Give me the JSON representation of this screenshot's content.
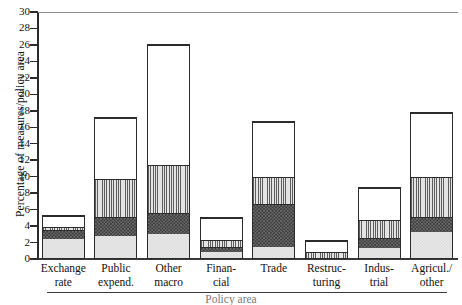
{
  "chart_data": {
    "type": "bar",
    "stacked": true,
    "title": "",
    "xlabel": "Policy area",
    "ylabel": "Percentage of measures/policy area",
    "ylim": [
      0,
      30
    ],
    "ytick_step": 2,
    "yticks": [
      30,
      28,
      26,
      24,
      22,
      20,
      18,
      16,
      14,
      12,
      10,
      8,
      6,
      4,
      2,
      0
    ],
    "grid": false,
    "legend": "none",
    "categories": [
      "Exchange rate",
      "Public expend.",
      "Other macro",
      "Financial",
      "Trade",
      "Restructuring",
      "Industrial",
      "Agricul./other"
    ],
    "category_lines": [
      [
        "Exchange",
        "rate"
      ],
      [
        "Public",
        "expend."
      ],
      [
        "Other",
        "macro"
      ],
      [
        "Finan-",
        "cial"
      ],
      [
        "Trade",
        ""
      ],
      [
        "Restruc-",
        "turing"
      ],
      [
        "Indus-",
        "trial"
      ],
      [
        "Agricul./",
        "other"
      ]
    ],
    "series": [
      {
        "name": "segment-1",
        "fill": "light-gray-check",
        "values": [
          2.4,
          2.7,
          3.0,
          0.8,
          1.4,
          0.0,
          1.2,
          3.2
        ]
      },
      {
        "name": "segment-2",
        "fill": "dark-check",
        "values": [
          1.2,
          2.4,
          2.5,
          0.6,
          5.3,
          0.0,
          1.3,
          1.9
        ]
      },
      {
        "name": "segment-3",
        "fill": "vertical-stripe",
        "values": [
          0.3,
          4.6,
          5.9,
          0.9,
          3.3,
          0.8,
          2.2,
          4.9
        ]
      },
      {
        "name": "segment-4",
        "fill": "white",
        "values": [
          1.4,
          7.5,
          14.7,
          2.8,
          6.8,
          1.5,
          4.0,
          7.8
        ]
      }
    ],
    "totals": [
      5.3,
      17.2,
      26.1,
      5.1,
      16.8,
      2.3,
      8.7,
      17.8
    ]
  },
  "colors": {
    "axis": "#2b2b2b",
    "segment_1": "#e7e7e7",
    "segment_2": "#3b3b3b",
    "segment_3": "#d2d2d2",
    "segment_4": "#ffffff",
    "background": "#ffffff"
  }
}
